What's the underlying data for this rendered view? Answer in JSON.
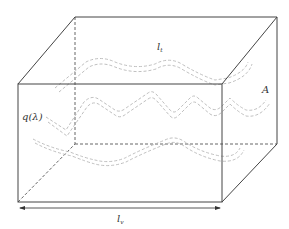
{
  "diagram": {
    "type": "3d-box-with-tubes",
    "colors": {
      "edge": "#444444",
      "hidden_edge": "#555555",
      "tube": "#b8b8b8",
      "text": "#333333",
      "background": "#ffffff"
    },
    "labels": {
      "top_path": {
        "main": "l",
        "sub": "t"
      },
      "area": "A",
      "flux": "q(λ)",
      "length": {
        "main": "l",
        "sub": "v"
      }
    }
  }
}
